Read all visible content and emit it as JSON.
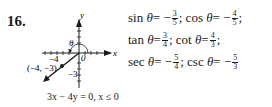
{
  "problem": {
    "number": "16."
  },
  "graph": {
    "x_axis_label": "x",
    "y_axis_label": "y",
    "theta_label": "θ",
    "zero_label": "0",
    "x_tick_label": "−4",
    "y_tick_label": "−3",
    "point_label": "(−4, −3)",
    "caption": "3x − 4y = 0, x ≤ 0"
  },
  "equations": {
    "sin": {
      "name": "sin",
      "var": "θ",
      "eq": " = −",
      "num": "3",
      "den": "5",
      "sep": "; "
    },
    "cos": {
      "name": "cos",
      "var": "θ",
      "eq": " = −",
      "num": "4",
      "den": "5",
      "sep": ";"
    },
    "tan": {
      "name": "tan",
      "var": "θ",
      "eq": " = ",
      "num": "3",
      "den": "4",
      "sep": "; "
    },
    "cot": {
      "name": "cot",
      "var": "θ",
      "eq": " = ",
      "num": "4",
      "den": "3",
      "sep": ";"
    },
    "sec": {
      "name": "sec",
      "var": "θ",
      "eq": " = −",
      "num": "5",
      "den": "4",
      "sep": "; "
    },
    "csc": {
      "name": "csc",
      "var": "θ",
      "eq": " = −",
      "num": "5",
      "den": "3",
      "sep": ""
    }
  }
}
